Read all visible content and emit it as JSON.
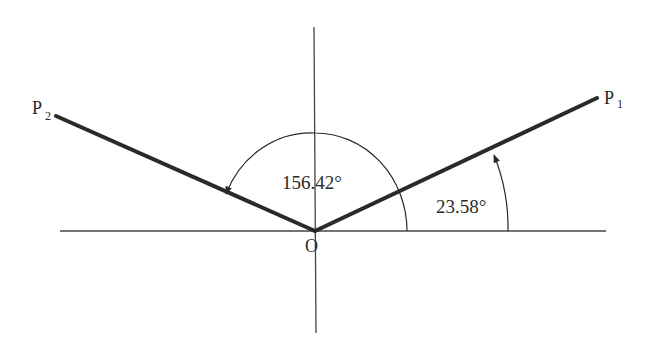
{
  "diagram": {
    "type": "angle-diagram",
    "origin_label": "O",
    "points": [
      {
        "label": "P",
        "subscript": "1"
      },
      {
        "label": "P",
        "subscript": "2"
      }
    ],
    "angles": [
      {
        "value": "23.58°",
        "from": "positive x-axis",
        "to": "OP1"
      },
      {
        "value": "156.42°",
        "from": "positive x-axis",
        "to": "OP2"
      }
    ],
    "colors": {
      "line": "#2a2a2a",
      "background": "#ffffff"
    }
  }
}
